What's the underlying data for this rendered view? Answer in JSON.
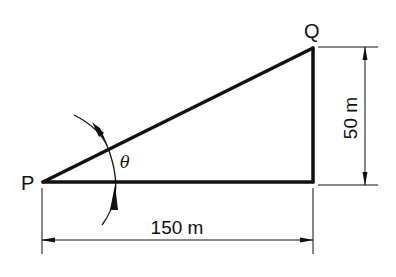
{
  "diagram": {
    "type": "right-triangle",
    "points": {
      "P": {
        "label": "P"
      },
      "Q": {
        "label": "Q"
      }
    },
    "angle": {
      "label": "θ"
    },
    "dimensions": {
      "horizontal": {
        "label": "150 m",
        "value": 150,
        "unit": "m"
      },
      "vertical": {
        "label": "50 m",
        "value": 50,
        "unit": "m"
      }
    },
    "colors": {
      "line": "#111111",
      "background": "#ffffff"
    }
  }
}
